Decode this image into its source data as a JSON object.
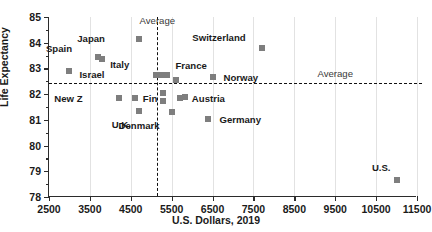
{
  "chart_data": {
    "type": "scatter",
    "title": "",
    "xlabel": "U.S. Dollars, 2019",
    "ylabel": "Life Expectancy",
    "xlim": [
      2500,
      11500
    ],
    "ylim": [
      78,
      85
    ],
    "xticks": [
      2500,
      3500,
      4500,
      5500,
      6500,
      7500,
      8500,
      9500,
      10500,
      11500
    ],
    "yticks": [
      78,
      79,
      80,
      81,
      82,
      83,
      84,
      85
    ],
    "grid": "vertical-major",
    "legend": "none",
    "marker_color": "#7e7e7e",
    "reference_lines": [
      {
        "name": "horizontal-average",
        "orientation": "horizontal",
        "value": 82.42,
        "label": "Average",
        "label_x": 9500,
        "style": "dashed"
      },
      {
        "name": "vertical-average",
        "orientation": "vertical",
        "value": 5150,
        "label": "Average",
        "label_x": 5150,
        "label_y": 84.85,
        "style": "dashed"
      }
    ],
    "points": [
      {
        "label": "Israel",
        "x": 3000,
        "y": 82.9,
        "label_dx": 10,
        "label_dy": 4
      },
      {
        "label": "Spain",
        "x": 3700,
        "y": 83.45,
        "label_dx": -26,
        "label_dy": -8
      },
      {
        "label": "Italy",
        "x": 3800,
        "y": 83.35,
        "label_dx": 8,
        "label_dy": 6
      },
      {
        "label": "Japan",
        "x": 4700,
        "y": 84.15,
        "label_dx": -34,
        "label_dy": 0
      },
      {
        "label": "New Z",
        "x": 4200,
        "y": 81.85,
        "label_dx": -36,
        "label_dy": 1
      },
      {
        "label": "Fin",
        "x": 4600,
        "y": 81.85,
        "label_dx": 8,
        "label_dy": 1
      },
      {
        "label": "U.K.",
        "x": 4700,
        "y": 81.35,
        "label_dx": -8,
        "label_dy": 14
      },
      {
        "label": "France",
        "x": 5250,
        "y": 82.75,
        "label_dx": 14,
        "label_dy": -9
      },
      {
        "label": "",
        "x": 5380,
        "y": 82.75,
        "label_dx": 0,
        "label_dy": 0
      },
      {
        "label": "",
        "x": 5120,
        "y": 82.75,
        "label_dx": 0,
        "label_dy": 0
      },
      {
        "label": "",
        "x": 5600,
        "y": 82.55,
        "label_dx": 0,
        "label_dy": 0
      },
      {
        "label": "",
        "x": 5300,
        "y": 82.05,
        "label_dx": 0,
        "label_dy": 0
      },
      {
        "label": "",
        "x": 5300,
        "y": 81.75,
        "label_dx": 0,
        "label_dy": 0
      },
      {
        "label": "Austria",
        "x": 5700,
        "y": 81.85,
        "label_dx": 12,
        "label_dy": 1
      },
      {
        "label": "",
        "x": 5820,
        "y": 81.9,
        "label_dx": 0,
        "label_dy": 0
      },
      {
        "label": "Denmark",
        "x": 5500,
        "y": 81.3,
        "label_dx": -12,
        "label_dy": 14
      },
      {
        "label": "Germany",
        "x": 6400,
        "y": 81.05,
        "label_dx": 11,
        "label_dy": 1
      },
      {
        "label": "Norway",
        "x": 6500,
        "y": 82.65,
        "label_dx": 11,
        "label_dy": 1
      },
      {
        "label": "Switzerland",
        "x": 7700,
        "y": 83.8,
        "label_dx": -16,
        "label_dy": -10
      },
      {
        "label": "U.S.",
        "x": 11000,
        "y": 78.65,
        "label_dx": -6,
        "label_dy": -12
      }
    ]
  }
}
